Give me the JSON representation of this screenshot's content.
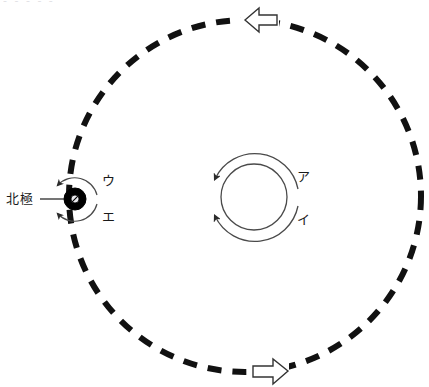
{
  "figure": {
    "title_cut_text": "- -  -    -  -",
    "watermark_glyph": "",
    "labels": {
      "north_pole": "北極",
      "sun_rotation_upper": "ア",
      "sun_rotation_lower": "イ",
      "earth_rotation_upper": "ウ",
      "earth_rotation_lower": "エ"
    },
    "colors": {
      "stroke": "#1a1a1a",
      "orbit_dash": "#111111",
      "thin_line": "#4a4a4a",
      "background": "#ffffff",
      "earth_fill": "#000000",
      "arrow_fill": "#ffffff"
    },
    "geometry": {
      "orbit_center_x": 245,
      "orbit_center_y": 196,
      "orbit_radius": 176,
      "orbit_dash_pattern": "14 11",
      "orbit_stroke_width": 6,
      "sun_center_x": 254,
      "sun_center_y": 197,
      "sun_radius": 33,
      "sun_arc_radius": 44,
      "earth_center_x": 75,
      "earth_center_y": 199,
      "earth_radius": 11,
      "earth_inner_radius": 4,
      "earth_arc_radius": 23
    },
    "markers": {
      "orbit_arrow_top_direction": "left",
      "orbit_arrow_top_x": 258,
      "orbit_arrow_top_y": 20,
      "orbit_arrow_bottom_direction": "right",
      "orbit_arrow_bottom_x": 272,
      "orbit_arrow_bottom_y": 371
    },
    "leader_line": {
      "x1": 40,
      "y1": 199,
      "x2": 64,
      "y2": 199
    }
  }
}
